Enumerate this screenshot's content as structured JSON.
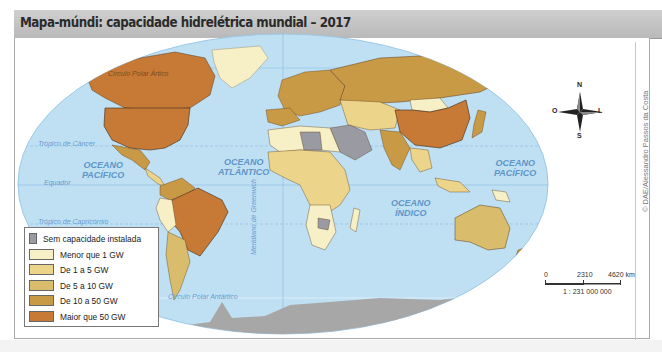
{
  "title": "Mapa-múndi: capacidade hidrelétrica mundial – 2017",
  "credit": "© DAE/Alessandro Passos da Costa",
  "legend": {
    "items": [
      {
        "label": "Sem capacidade instalada",
        "color": "#9a9aa2"
      },
      {
        "label": "Menor que 1 GW",
        "color": "#f7f0c6"
      },
      {
        "label": "De 1 a 5 GW",
        "color": "#ecd58a"
      },
      {
        "label": "De 5 a 10 GW",
        "color": "#d9bd6c"
      },
      {
        "label": "De 10 a 50 GW",
        "color": "#c99a45"
      },
      {
        "label": "Maior que 50 GW",
        "color": "#c67a36"
      }
    ]
  },
  "map_labels": {
    "arctic_circle": "Círculo Polar Ártico",
    "antarctic_circle": "Círculo Polar Antártico",
    "tropic_cancer": "Trópico de Câncer",
    "tropic_capricorn": "Trópico de Capricórnio",
    "equator": "Equador",
    "greenwich": "Meridiano de Greenwich",
    "pacific_west": [
      "OCEANO",
      "PACÍFICO"
    ],
    "atlantic": [
      "OCEANO",
      "ATLÂNTICO"
    ],
    "indian": [
      "OCEANO",
      "ÍNDICO"
    ],
    "pacific_east": [
      "OCEANO",
      "PACÍFICO"
    ]
  },
  "compass": {
    "n": "N",
    "s": "S",
    "e": "L",
    "w": "O"
  },
  "scale": {
    "zero": "0",
    "mid": "2310",
    "end": "4620 km",
    "ratio": "1 : 231 000 000"
  },
  "colors": {
    "ocean": "#bfe0f3",
    "antarctica": "#a8a7a8",
    "frame": "#aaaaaa"
  }
}
